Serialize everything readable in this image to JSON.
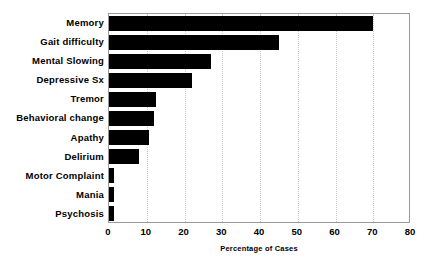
{
  "chart_data": {
    "type": "bar",
    "orientation": "horizontal",
    "title": "",
    "xlabel": "Percentage of Cases",
    "ylabel": "",
    "xlim": [
      0,
      80
    ],
    "xticks": [
      0,
      10,
      20,
      30,
      40,
      50,
      60,
      70,
      80
    ],
    "grid": "vertical-dotted",
    "legend": "none",
    "bar_color": "#000000",
    "categories": [
      "Memory",
      "Gait difficulty",
      "Mental Slowing",
      "Depressive Sx",
      "Tremor",
      "Behavioral change",
      "Apathy",
      "Delirium",
      "Motor Complaint",
      "Mania",
      "Psychosis"
    ],
    "values": [
      70,
      45,
      27,
      22,
      12.5,
      12,
      10.5,
      8,
      1.2,
      1.2,
      1.2
    ]
  },
  "axis_colors": {
    "frame": "#9a9a9a",
    "gridline": "#c8c8c8",
    "bar": "#000000",
    "text": "#000000"
  }
}
